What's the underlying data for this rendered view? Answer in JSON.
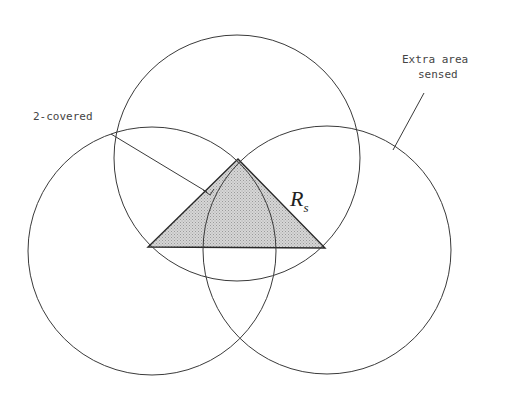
{
  "figure": {
    "labels": {
      "two_covered": "2-covered",
      "extra_area_line1": "Extra area",
      "extra_area_line2": "sensed",
      "radius_main": "R",
      "radius_sub": "s"
    },
    "colors": {
      "stroke": "#3a3a3a",
      "triangle_fill": "#c8c8c8",
      "text": "#444444"
    },
    "circles": [
      {
        "name": "top",
        "cx": 237,
        "cy": 158,
        "r": 124
      },
      {
        "name": "left",
        "cx": 152,
        "cy": 251,
        "r": 124
      },
      {
        "name": "right",
        "cx": 327,
        "cy": 250,
        "r": 124
      }
    ],
    "triangle": [
      [
        238,
        159
      ],
      [
        148,
        247
      ],
      [
        325,
        248
      ]
    ]
  }
}
